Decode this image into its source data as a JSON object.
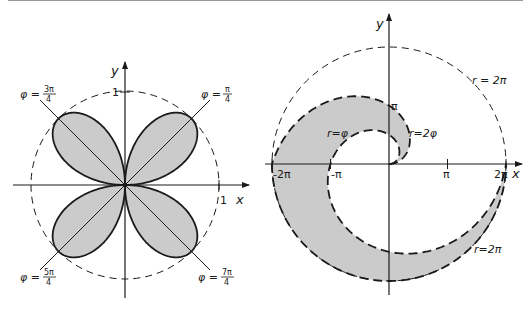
{
  "colors": {
    "ink": "#1a1a1a",
    "fill": "#cbcbcb",
    "background": "#ffffff"
  },
  "left_figure": {
    "name": "four-leaf rose",
    "curve": "r = |sin 2φ|",
    "origin": [
      125,
      185
    ],
    "unit_px": 94,
    "axis_labels": {
      "x": "x",
      "y": "y"
    },
    "tick_labels": {
      "x_one": "1",
      "y_one": "1"
    },
    "unit_circle": "dashed, radius 1",
    "rays": [
      {
        "label_lhs": "φ =",
        "num": "π",
        "den": "4",
        "angle_deg": 45
      },
      {
        "label_lhs": "φ =",
        "num": "3π",
        "den": "4",
        "angle_deg": 135
      },
      {
        "label_lhs": "φ =",
        "num": "5π",
        "den": "4",
        "angle_deg": 225
      },
      {
        "label_lhs": "φ =",
        "num": "7π",
        "den": "4",
        "angle_deg": 315
      }
    ]
  },
  "right_figure": {
    "name": "region between spirals",
    "origin": [
      389,
      164
    ],
    "px_per_pi": 58.5,
    "axis_labels": {
      "x": "x",
      "y": "y"
    },
    "x_ticks": [
      "-2π",
      "-π",
      "π",
      "2π"
    ],
    "y_tick": "π",
    "curve_labels": {
      "inner": "r=φ",
      "outer": "r=2φ",
      "circle_top": "r = 2π",
      "circle_bottom": "r=2π"
    },
    "region": "φ ≤ r ≤ min(2φ, 2π), 0 ≤ φ ≤ 2π"
  }
}
